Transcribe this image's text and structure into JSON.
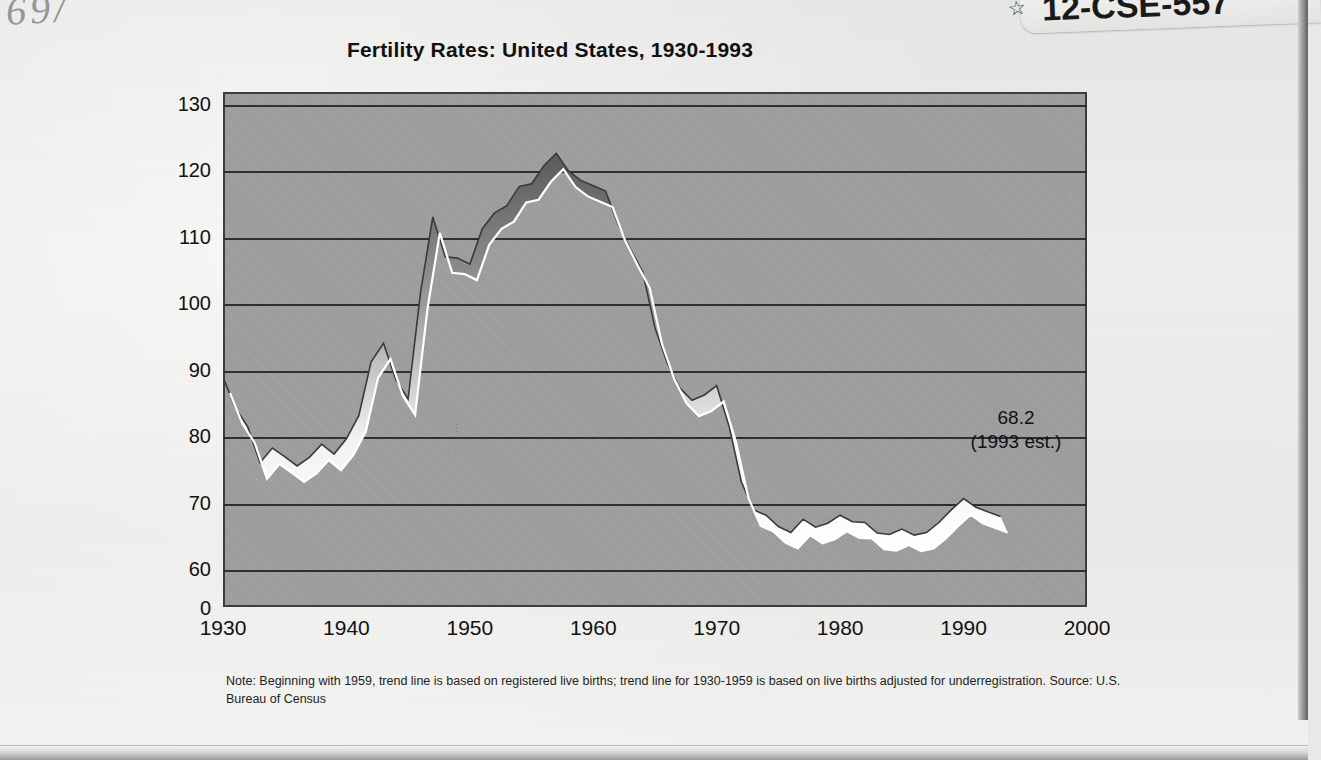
{
  "document": {
    "handwriting": "69/",
    "sticker_label": "12-CSE-557",
    "sticker_mark": "☆"
  },
  "chart_data": {
    "type": "area",
    "title": "Fertility Rates:  United States, 1930-1993",
    "xlabel": "",
    "ylabel": "",
    "xlim": [
      1930,
      2000
    ],
    "ylim": [
      55,
      130
    ],
    "grid": true,
    "legend": null,
    "y_ticks": [
      "130",
      "120",
      "110",
      "100",
      "90",
      "80",
      "70",
      "60",
      "0"
    ],
    "y_tick_values": [
      130,
      120,
      110,
      100,
      90,
      80,
      70,
      60,
      0
    ],
    "x_ticks": [
      "1930",
      "1940",
      "1950",
      "1960",
      "1970",
      "1980",
      "1990",
      "2000"
    ],
    "x_tick_values": [
      1930,
      1940,
      1950,
      1960,
      1970,
      1980,
      1990,
      2000
    ],
    "annotations": [
      {
        "text_line1": "68.2",
        "text_line2": "(1993 est.)",
        "x": 1993,
        "y": 68.2
      }
    ],
    "note": "Note:  Beginning with 1959, trend line is based on registered live births; trend line for 1930-1959 is based on live births adjusted for underregistration.  Source: U.S. Bureau of Census",
    "x": [
      1930,
      1931,
      1932,
      1933,
      1934,
      1935,
      1936,
      1937,
      1938,
      1939,
      1940,
      1941,
      1942,
      1943,
      1944,
      1945,
      1946,
      1947,
      1948,
      1949,
      1950,
      1951,
      1952,
      1953,
      1954,
      1955,
      1956,
      1957,
      1958,
      1959,
      1960,
      1961,
      1962,
      1963,
      1964,
      1965,
      1966,
      1967,
      1968,
      1969,
      1970,
      1971,
      1972,
      1973,
      1974,
      1975,
      1976,
      1977,
      1978,
      1979,
      1980,
      1981,
      1982,
      1983,
      1984,
      1985,
      1986,
      1987,
      1988,
      1989,
      1990,
      1991,
      1992,
      1993
    ],
    "values": [
      89.2,
      84.6,
      81.7,
      76.3,
      78.5,
      77.2,
      75.8,
      77.1,
      79.1,
      77.6,
      79.9,
      83.4,
      91.5,
      94.3,
      88.8,
      85.9,
      101.9,
      113.3,
      107.3,
      107.1,
      106.2,
      111.5,
      113.9,
      115.0,
      117.9,
      118.3,
      121.0,
      122.9,
      120.2,
      118.8,
      118.0,
      117.2,
      112.2,
      108.5,
      105.0,
      96.6,
      91.3,
      87.6,
      85.7,
      86.5,
      87.9,
      81.8,
      73.4,
      69.2,
      68.4,
      66.7,
      65.8,
      67.8,
      66.6,
      67.2,
      68.4,
      67.4,
      67.3,
      65.7,
      65.5,
      66.3,
      65.4,
      65.8,
      67.3,
      69.2,
      70.9,
      69.6,
      68.9,
      68.2
    ]
  }
}
